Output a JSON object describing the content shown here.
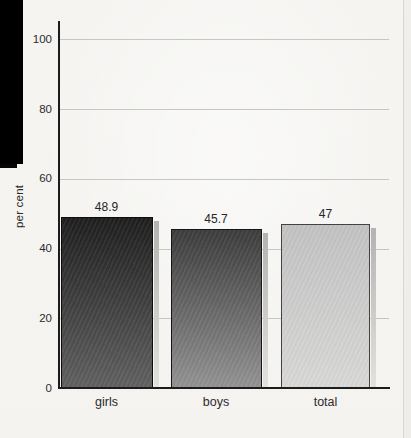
{
  "page": {
    "background_color": "#f5f4f1",
    "scan_margin_color": "#000000",
    "page_edge_color": "#d8d7d4"
  },
  "chart_data": {
    "type": "bar",
    "title": "",
    "xlabel": "",
    "ylabel": "per cent",
    "categories": [
      "girls",
      "boys",
      "total"
    ],
    "values": [
      48.9,
      45.7,
      47
    ],
    "value_labels": [
      "48.9",
      "45.7",
      "47"
    ],
    "ylim": [
      0,
      100
    ],
    "yticks": [
      0,
      20,
      40,
      60,
      80,
      100
    ],
    "ytick_labels": [
      "0",
      "20",
      "40",
      "60",
      "80",
      "100"
    ],
    "grid": "horizontal",
    "legend": "none",
    "gridline_color": "#c7c6c3",
    "axis_color": "#1c1c1c",
    "text_color": "#2b2b2b",
    "shadow_top_color": "#b3b3b1",
    "shadow_bottom_color": "#e2e1de",
    "bars": [
      {
        "category": "girls",
        "value": 48.9,
        "label": "48.9",
        "gradient_top": "#1f1f1f",
        "gradient_bottom": "#616161",
        "border_color": "#0d0d0d"
      },
      {
        "category": "boys",
        "value": 45.7,
        "label": "45.7",
        "gradient_top": "#3d3d3d",
        "gradient_bottom": "#939393",
        "border_color": "#161616"
      },
      {
        "category": "total",
        "value": 47,
        "label": "47",
        "gradient_top": "#c3c3c3",
        "gradient_bottom": "#d9d9d8",
        "border_color": "#424242"
      }
    ]
  }
}
